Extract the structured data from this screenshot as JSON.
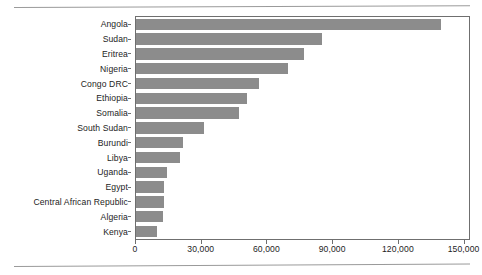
{
  "chart_data": {
    "type": "bar",
    "orientation": "horizontal",
    "title": "",
    "subtitle": "",
    "xlabel": "",
    "ylabel": "",
    "grid": false,
    "legend": null,
    "xlim": [
      0,
      152000
    ],
    "xticks": [
      0,
      30000,
      60000,
      90000,
      120000,
      150000
    ],
    "xtick_labels": [
      "0",
      "30,000",
      "60,000",
      "90,000",
      "120,000",
      "150,000"
    ],
    "categories": [
      "Angola",
      "Sudan",
      "Eritrea",
      "Nigeria",
      "Congo DRC",
      "Ethiopia",
      "Somalia",
      "South Sudan",
      "Burundi",
      "Libya",
      "Uganda",
      "Egypt",
      "Central African Republic",
      "Algeria",
      "Kenya"
    ],
    "values": [
      139000,
      85000,
      76500,
      69500,
      56000,
      50500,
      47000,
      31000,
      21500,
      20000,
      14000,
      13000,
      13000,
      12500,
      9500
    ],
    "bar_color": "#8c8c8c",
    "frame_color": "#6f6f6f",
    "background": "#ffffff",
    "text_color": "#1d1d1d"
  }
}
